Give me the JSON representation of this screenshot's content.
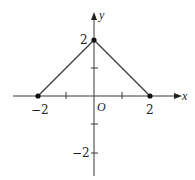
{
  "diagram": {
    "type": "coordinate-plot",
    "axes": {
      "x_label": "x",
      "y_label": "y",
      "origin_label": "O",
      "x_ticks": [
        -2,
        -1,
        1,
        2
      ],
      "y_ticks": [
        -2,
        -1,
        1,
        2
      ],
      "x_tick_labels": [
        "−2",
        "2"
      ],
      "y_tick_labels": [
        "2",
        "−2"
      ]
    },
    "points": [
      {
        "x": -2,
        "y": 0,
        "label": "−2"
      },
      {
        "x": 0,
        "y": 2,
        "label": "2"
      },
      {
        "x": 2,
        "y": 0,
        "label": "2"
      }
    ],
    "segments": [
      {
        "from": [
          -2,
          0
        ],
        "to": [
          0,
          2
        ]
      },
      {
        "from": [
          0,
          2
        ],
        "to": [
          2,
          0
        ]
      }
    ],
    "labels": {
      "x_axis": "x",
      "y_axis": "y",
      "origin": "O",
      "x_neg2": "−2",
      "x_pos2": "2",
      "y_pos2": "2",
      "y_neg2": "−2"
    },
    "colors": {
      "line": "#3a3a3a",
      "point": "#111111",
      "background": "#ffffff"
    }
  }
}
